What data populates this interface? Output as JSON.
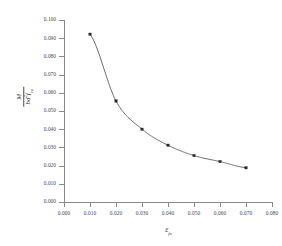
{
  "chart_data": {
    "type": "line",
    "title": "",
    "xlabel": "ε fu",
    "ylabel": "M / (b d² f cu)",
    "x": [
      0.01,
      0.02,
      0.03,
      0.04,
      0.05,
      0.06,
      0.07
    ],
    "values": [
      0.0922,
      0.0555,
      0.04,
      0.0312,
      0.0255,
      0.0222,
      0.0188
    ],
    "series": [
      {
        "name": "M/(bd²f_cu) vs strain",
        "x": [
          0.01,
          0.02,
          0.03,
          0.04,
          0.05,
          0.06,
          0.07
        ],
        "values": [
          0.0922,
          0.0555,
          0.04,
          0.0312,
          0.0255,
          0.0222,
          0.0188
        ]
      }
    ],
    "xlim": [
      0.0,
      0.08
    ],
    "ylim": [
      0.0,
      0.1
    ],
    "xticks": [
      0.0,
      0.01,
      0.02,
      0.03,
      0.04,
      0.05,
      0.06,
      0.07,
      0.08
    ],
    "yticks": [
      0.0,
      0.01,
      0.02,
      0.03,
      0.04,
      0.05,
      0.06,
      0.07,
      0.08,
      0.09,
      0.1
    ],
    "xtick_labels": [
      "0.000",
      "0.010",
      "0.020",
      "0.030",
      "0.040",
      "0.050",
      "0.060",
      "0.070",
      "0.080"
    ],
    "ytick_labels": [
      "0.000",
      "0.010",
      "0.020",
      "0.030",
      "0.040",
      "0.050",
      "0.060",
      "0.070",
      "0.080",
      "0.090",
      "0.100"
    ],
    "grid": false,
    "legend": null,
    "marker": "square",
    "line_color": "#595959",
    "marker_color": "#2b2b2b"
  },
  "axes": {
    "x_title_symbol": "ε",
    "x_title_subscript": "fu",
    "y_title_numerator": "M",
    "y_title_denominator_b": "b",
    "y_title_denominator_d": "d",
    "y_title_denominator_d_exp": "2",
    "y_title_denominator_f": "f",
    "y_title_denominator_f_sub": "cu"
  }
}
